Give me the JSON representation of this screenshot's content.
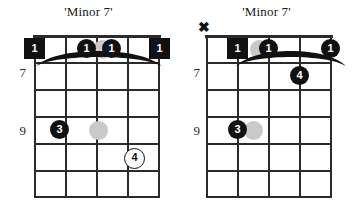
{
  "page": {
    "background": "#ffffff",
    "width": 355,
    "height": 214
  },
  "colors": {
    "ink": "#111111",
    "grid": "#2b2b2b",
    "ghost": "#c9c9c9",
    "paper": "#ffffff"
  },
  "diagrams": [
    {
      "id": "chord-diagram-left",
      "title": "'Minor 7'",
      "strings": 6,
      "frets": 6,
      "fret_labels": [
        {
          "text": "7",
          "fret_index": 1
        },
        {
          "text": "9",
          "fret_index": 3
        }
      ],
      "barre": {
        "from_string": 1,
        "to_string": 6,
        "fret": 1,
        "label": "barre-curve"
      },
      "mutes": [],
      "markers": [
        {
          "shape": "square",
          "label": "1",
          "string": 1,
          "fret": 1,
          "name": "root-marker"
        },
        {
          "shape": "circle",
          "label": "1",
          "string": 3,
          "fret": 1,
          "name": "finger-dot"
        },
        {
          "shape": "ghost",
          "label": "",
          "string": 4,
          "fret": 1,
          "name": "ghost-dot"
        },
        {
          "shape": "circle",
          "label": "1",
          "string": 4,
          "fret": 1,
          "name": "finger-dot"
        },
        {
          "shape": "square",
          "label": "1",
          "string": 6,
          "fret": 1,
          "name": "root-marker"
        },
        {
          "shape": "circle",
          "label": "3",
          "string": 2,
          "fret": 3,
          "name": "finger-dot"
        },
        {
          "shape": "ghost",
          "label": "",
          "string": 3,
          "fret": 3,
          "name": "ghost-dot"
        },
        {
          "shape": "open",
          "label": "4",
          "string": 5,
          "fret": 4,
          "name": "optional-finger-dot"
        }
      ]
    },
    {
      "id": "chord-diagram-right",
      "title": "'Minor 7'",
      "strings": 6,
      "frets": 6,
      "fret_labels": [
        {
          "text": "7",
          "fret_index": 1
        },
        {
          "text": "9",
          "fret_index": 3
        }
      ],
      "barre": {
        "from_string": 2,
        "to_string": 6,
        "fret": 1,
        "label": "barre-curve"
      },
      "mutes": [
        {
          "text": "✖",
          "string": 1,
          "name": "mute-x-marker"
        }
      ],
      "markers": [
        {
          "shape": "square",
          "label": "1",
          "string": 2,
          "fret": 1,
          "name": "root-marker"
        },
        {
          "shape": "ghost",
          "label": "",
          "string": 3,
          "fret": 1,
          "name": "ghost-dot"
        },
        {
          "shape": "circle",
          "label": "1",
          "string": 4,
          "fret": 1,
          "name": "finger-dot"
        },
        {
          "shape": "circle",
          "label": "1",
          "string": 6,
          "fret": 1,
          "name": "finger-dot"
        },
        {
          "shape": "circle",
          "label": "4",
          "string": 5,
          "fret": 2,
          "name": "finger-dot"
        },
        {
          "shape": "circle",
          "label": "3",
          "string": 3,
          "fret": 3,
          "name": "finger-dot"
        },
        {
          "shape": "ghost",
          "label": "",
          "string": 4,
          "fret": 3,
          "name": "ghost-dot"
        }
      ]
    }
  ]
}
